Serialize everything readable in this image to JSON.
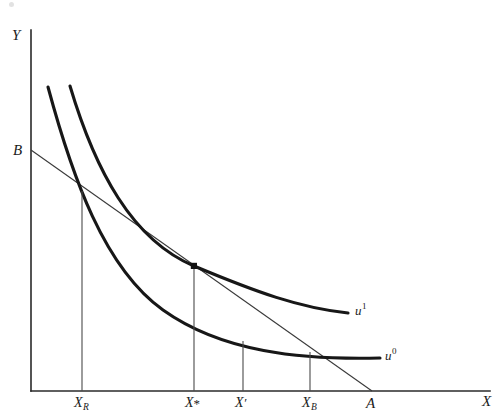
{
  "figure": {
    "kind": "indifference-curve-budget-line-diagram",
    "background_color": "#ffffff",
    "ink_color": "#171717"
  },
  "axes": {
    "y_label": "Y",
    "x_label": "X",
    "origin": {
      "x": 31,
      "y": 391
    },
    "y_top": {
      "x": 31,
      "y": 30
    },
    "x_right": {
      "x": 490,
      "y": 391
    }
  },
  "budget_line": {
    "name": "budget-line",
    "intercept_label": "B",
    "endpoint_label": "A",
    "y_intercept_point": {
      "x": 31,
      "y": 150
    },
    "x_intercept_point": {
      "x": 372,
      "y": 391
    },
    "color": "#3a3a3a"
  },
  "curves": [
    {
      "id": "u0",
      "label": "u",
      "superscript": "0",
      "label_position": {
        "x": 385,
        "y": 349
      },
      "path": "M 48 87 C 72 176, 104 268, 163 310 C 222 352, 300 360, 380 358",
      "color": "#171717"
    },
    {
      "id": "u1",
      "label": "u",
      "superscript": "1",
      "label_position": {
        "x": 355,
        "y": 304
      },
      "path": "M 70 86 C 95 170, 132 240, 194 266 C 256 292, 300 308, 348 313",
      "color": "#171717"
    }
  ],
  "tangency_point": {
    "name": "tangency-point",
    "x": 194,
    "y": 266,
    "radius": 3.1
  },
  "x_ticks": [
    {
      "id": "XR",
      "label": "X",
      "sub": "R",
      "x": 82,
      "drop_top_y": 191,
      "label_x": 74,
      "label_y": 396
    },
    {
      "id": "Xstar",
      "label": "X",
      "sup": "*",
      "x": 194,
      "drop_top_y": 266,
      "label_x": 185,
      "label_y": 396
    },
    {
      "id": "Xprime",
      "label": "X",
      "prime": "′",
      "x": 243,
      "drop_top_y": 341,
      "label_x": 235,
      "label_y": 396
    },
    {
      "id": "XB",
      "label": "X",
      "sub": "B",
      "x": 310,
      "drop_top_y": 352,
      "label_x": 302,
      "label_y": 396
    }
  ],
  "point_labels": [
    {
      "id": "B",
      "text": "B",
      "x": 13,
      "y": 143
    },
    {
      "id": "A",
      "text": "A",
      "x": 366,
      "y": 396
    },
    {
      "id": "Y",
      "text": "Y",
      "x": 12,
      "y": 28
    },
    {
      "id": "X",
      "text": "X",
      "x": 482,
      "y": 394
    }
  ],
  "artifacts": [
    {
      "id": "scan-speck",
      "x": 9,
      "y": 2
    }
  ]
}
